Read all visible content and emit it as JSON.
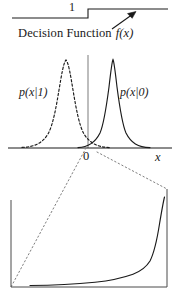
{
  "figure": {
    "background_color": "#ffffff",
    "ink_color": "#1a1a1a",
    "guide_color": "#8d8d8d"
  },
  "top_panel": {
    "name": "decision-function-step",
    "level_label": "1",
    "caption_text": "Decision Function",
    "caption_symbol": "f(x)",
    "arrow": {
      "name": "annotation-arrow",
      "direction": "up-right",
      "from_x": 112,
      "from_y": 28,
      "to_x": 136,
      "to_y": 12
    },
    "step": {
      "low_level_y": 18,
      "high_level_y": 9,
      "threshold_x": 88,
      "x_start": 12,
      "x_end": 168,
      "low_value": 0,
      "high_value": 1
    }
  },
  "middle_panel": {
    "name": "class-conditional-densities",
    "curves": [
      {
        "name": "density-p-x-given-1",
        "label": "p(x|1)",
        "style": "dashed",
        "class_label": "1",
        "peak_x": 66,
        "peak_y": 60,
        "mean": -1.0,
        "sigma": 0.42
      },
      {
        "name": "density-p-x-given-0",
        "label": "p(x|0)",
        "style": "solid",
        "class_label": "0",
        "peak_x": 113,
        "peak_y": 60,
        "mean": 0.55,
        "sigma": 0.36
      }
    ],
    "axis": {
      "baseline_y": 148,
      "x_start": 8,
      "x_end": 172,
      "origin_tick_label": "0",
      "origin_x": 88,
      "axis_label": "x"
    },
    "threshold_line": {
      "name": "decision-threshold-line",
      "x": 88,
      "top_y": 55,
      "bottom_y": 148,
      "color": "#9a9a9a"
    }
  },
  "inset_panel": {
    "name": "magnified-overlap-inset",
    "box": {
      "left_x": 11,
      "right_x": 167,
      "bottom_y": 287,
      "left_top_y": 186,
      "right_top_y": 189
    },
    "leader_lines": [
      {
        "name": "leader-line-left",
        "from_x": 86,
        "from_y": 147,
        "to_x": 11,
        "to_y": 287,
        "style": "dotted"
      },
      {
        "name": "leader-line-right",
        "from_x": 96,
        "from_y": 152,
        "to_x": 167,
        "to_y": 188,
        "style": "dotted"
      }
    ],
    "curve": {
      "name": "magnified-tail-curve",
      "style": "solid",
      "description": "magnified overlap tail rising steeply at right edge"
    }
  }
}
